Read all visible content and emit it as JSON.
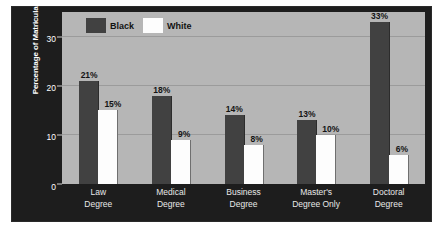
{
  "chart_data": {
    "type": "bar",
    "title": "",
    "xlabel": "",
    "ylabel": "Percentage of Matriculants",
    "ylim": [
      0,
      35
    ],
    "yticks": [
      0,
      10,
      20,
      30
    ],
    "ytick_labels": [
      "0",
      "10",
      "20",
      "30"
    ],
    "grid": true,
    "legend_position": "top-left",
    "categories": [
      "Law\nDegree",
      "Medical\nDegree",
      "Business\nDegree",
      "Master's\nDegree Only",
      "Doctoral\nDegree"
    ],
    "category_lines": [
      [
        "Law",
        "Degree"
      ],
      [
        "Medical",
        "Degree"
      ],
      [
        "Business",
        "Degree"
      ],
      [
        "Master's",
        "Degree Only"
      ],
      [
        "Doctoral",
        "Degree"
      ]
    ],
    "series": [
      {
        "name": "Black",
        "color": "#414141",
        "values": [
          21,
          18,
          14,
          13,
          33
        ],
        "labels": [
          "21%",
          "18%",
          "14%",
          "13%",
          "33%"
        ]
      },
      {
        "name": "White",
        "color": "#fdfdfd",
        "values": [
          15,
          9,
          8,
          10,
          6
        ],
        "labels": [
          "15%",
          "9%",
          "8%",
          "10%",
          "6%"
        ]
      }
    ]
  },
  "legend": {
    "items": [
      {
        "label": "Black",
        "swatch": "black"
      },
      {
        "label": "White",
        "swatch": "white"
      }
    ]
  },
  "colors": {
    "panel_background": "#1d1d1d",
    "plot_background": "#b6b6b6",
    "gridline": "#9b9b9b",
    "axis_text": "#ffffff",
    "data_label": "#141414",
    "bar_black": "#414141",
    "bar_white": "#fdfdfd"
  }
}
